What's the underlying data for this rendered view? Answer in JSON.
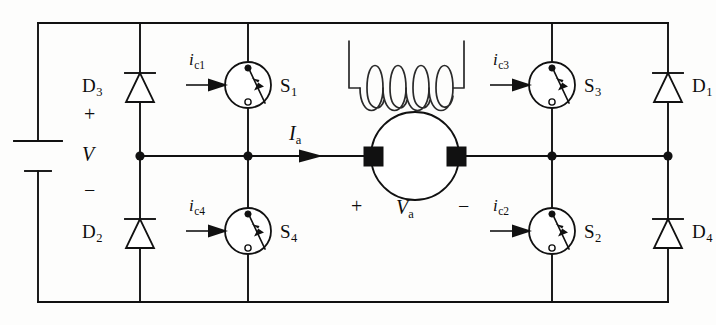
{
  "figure": {
    "name": "h-bridge-dc-motor-drive-circuit",
    "background_color": "#fdfdfc",
    "line_color": "#111111"
  },
  "source": {
    "label": "V",
    "plus_sign": "+",
    "minus_sign": "−",
    "symbol": "battery"
  },
  "diodes": [
    {
      "id": "D3",
      "label": "D",
      "subscript": "3",
      "symbol": "diode",
      "orientation": "cathode-up",
      "position": "upper-left"
    },
    {
      "id": "D2",
      "label": "D",
      "subscript": "2",
      "symbol": "diode",
      "orientation": "cathode-up",
      "position": "lower-left"
    },
    {
      "id": "D1",
      "label": "D",
      "subscript": "1",
      "symbol": "diode",
      "orientation": "cathode-up",
      "position": "upper-right"
    },
    {
      "id": "D4",
      "label": "D",
      "subscript": "4",
      "symbol": "diode",
      "orientation": "cathode-up",
      "position": "lower-right"
    }
  ],
  "switches": [
    {
      "id": "S1",
      "label": "S",
      "subscript": "1",
      "symbol": "controlled-switch",
      "position": "upper-left-inner",
      "control_current": {
        "label": "i",
        "subscript": "c1",
        "arrow": "right"
      }
    },
    {
      "id": "S4",
      "label": "S",
      "subscript": "4",
      "symbol": "controlled-switch",
      "position": "lower-left-inner",
      "control_current": {
        "label": "i",
        "subscript": "c4",
        "arrow": "right"
      }
    },
    {
      "id": "S3",
      "label": "S",
      "subscript": "3",
      "symbol": "controlled-switch",
      "position": "upper-right-inner",
      "control_current": {
        "label": "i",
        "subscript": "c3",
        "arrow": "right"
      }
    },
    {
      "id": "S2",
      "label": "S",
      "subscript": "2",
      "symbol": "controlled-switch",
      "position": "lower-right-inner",
      "control_current": {
        "label": "i",
        "subscript": "c2",
        "arrow": "right"
      }
    }
  ],
  "motor": {
    "field_winding": {
      "symbol": "field-coil",
      "turns": 4
    },
    "armature": {
      "symbol": "armature-circle",
      "voltage_label": "V",
      "voltage_subscript": "a",
      "plus_sign": "+",
      "minus_sign": "−",
      "brushes": 2
    },
    "armature_current": {
      "label": "I",
      "subscript": "a",
      "arrow": "right"
    }
  }
}
